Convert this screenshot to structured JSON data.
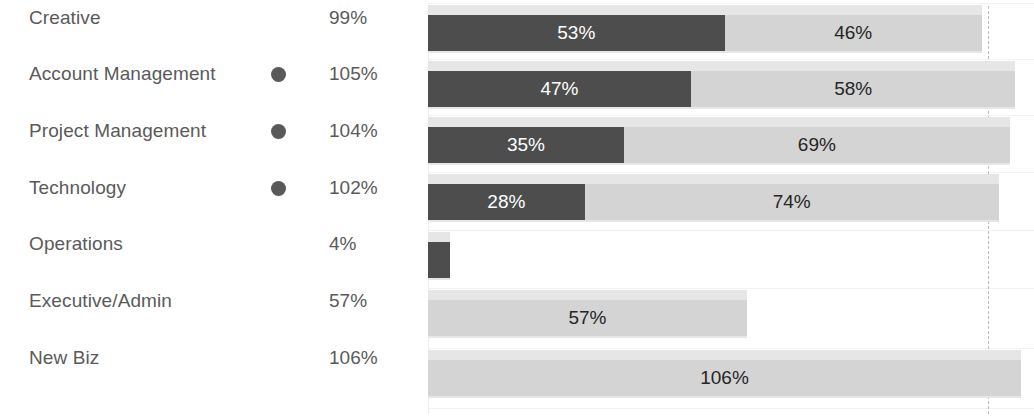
{
  "chart_data": {
    "type": "bar",
    "subtype": "stacked-horizontal",
    "title": "",
    "xlabel": "",
    "ylabel": "",
    "xlim": [
      0,
      108
    ],
    "grid": false,
    "legend": false,
    "reference_line": {
      "value": 100,
      "label": "100%",
      "style": "dashed"
    },
    "categories": [
      "Creative",
      "Account Management",
      "Project Management",
      "Technology",
      "Operations",
      "Executive/Admin",
      "New Biz"
    ],
    "totals": [
      "99%",
      "105%",
      "104%",
      "102%",
      "4%",
      "57%",
      "106%"
    ],
    "total_values": [
      99,
      105,
      104,
      102,
      4,
      57,
      106
    ],
    "markers": [
      false,
      true,
      true,
      true,
      false,
      false,
      false
    ],
    "series": [
      {
        "name": "dark",
        "values": [
          53,
          47,
          35,
          28,
          4,
          0,
          0
        ],
        "labels": [
          "53%",
          "47%",
          "35%",
          "28%",
          "",
          "",
          ""
        ],
        "color": "#4d4d4d"
      },
      {
        "name": "light",
        "values": [
          46,
          58,
          69,
          74,
          0,
          57,
          106
        ],
        "labels": [
          "46%",
          "58%",
          "69%",
          "74%",
          "",
          "57%",
          "106%"
        ],
        "color": "#d4d4d4"
      }
    ],
    "target_bar_color": "#e6e6e6",
    "target_values": [
      99,
      105,
      104,
      102,
      4,
      57,
      106
    ]
  },
  "rows": [
    {
      "name": "Creative",
      "total": "99%",
      "marker": false,
      "dark": 53,
      "dark_label": "53%",
      "light": 46,
      "light_label": "46%"
    },
    {
      "name": "Account Management",
      "total": "105%",
      "marker": true,
      "dark": 47,
      "dark_label": "47%",
      "light": 58,
      "light_label": "58%"
    },
    {
      "name": "Project Management",
      "total": "104%",
      "marker": true,
      "dark": 35,
      "dark_label": "35%",
      "light": 69,
      "light_label": "69%"
    },
    {
      "name": "Technology",
      "total": "102%",
      "marker": true,
      "dark": 28,
      "dark_label": "28%",
      "light": 74,
      "light_label": "74%"
    },
    {
      "name": "Operations",
      "total": "4%",
      "marker": false,
      "dark": 4,
      "dark_label": "",
      "light": 0,
      "light_label": ""
    },
    {
      "name": "Executive/Admin",
      "total": "57%",
      "marker": false,
      "dark": 0,
      "dark_label": "",
      "light": 57,
      "light_label": "57%"
    },
    {
      "name": "New Biz",
      "total": "106%",
      "marker": false,
      "dark": 0,
      "dark_label": "",
      "light": 106,
      "light_label": "106%"
    }
  ],
  "reference": {
    "label": "100%",
    "value": 100
  },
  "colors": {
    "dark_segment": "#4d4d4d",
    "light_segment": "#d4d4d4",
    "target_bar": "#e6e6e6",
    "text": "#5a5a5a",
    "reference_line": "#bdbdbd",
    "reference_label": "#c9c9c9",
    "background": "#ffffff"
  }
}
